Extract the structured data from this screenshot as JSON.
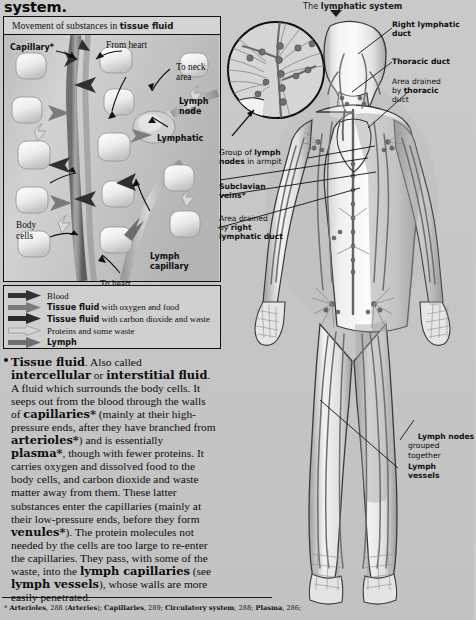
{
  "page": {
    "running_title": "system.",
    "figure_header_prefix": "The ",
    "figure_header_bold": "lymphatic system"
  },
  "panel": {
    "title_prefix": "Movement of substances in ",
    "title_bold": "tissue fluid",
    "labels": {
      "capillary": "Capillary*",
      "from_heart": "From heart",
      "to_neck_area": "To neck\narea",
      "lymph_node": "Lymph\nnode",
      "lymphatic": "Lymphatic",
      "body_cells": "Body\ncells",
      "to_heart": "To heart",
      "lymph_capillary": "Lymph\ncapillary"
    }
  },
  "legend": {
    "title": "Key",
    "rows": [
      {
        "color": "#3a3a3a",
        "style": "solid-dark",
        "bold": "",
        "text": "Blood"
      },
      {
        "color": "#7a7a7a",
        "style": "solid-mid",
        "bold": "Tissue fluid",
        "text": " with oxygen and food"
      },
      {
        "color": "#2e2e2e",
        "style": "solid-dark",
        "bold": "Tissue fluid",
        "text": " with carbon dioxide and waste"
      },
      {
        "color": "#c2c2c2",
        "style": "outline",
        "bold": "",
        "text": "Proteins and some waste"
      },
      {
        "color": "#6e6e6e",
        "style": "solid-mid",
        "bold": "Lymph",
        "text": ""
      }
    ]
  },
  "body_text": {
    "paragraph_html": "<b>Tissue fluid</b>. Also called <b>intercellular</b> or <b>interstitial fluid</b>. A fluid which surrounds the body cells. It seeps out from the blood through the walls of <b>capillaries*</b> (mainly at their high-pressure ends, after they have branched from <b>arterioles*</b>) and is essentially <b>plasma*</b>, though with fewer proteins. It carries oxygen and dissolved food to the body cells, and carbon dioxide and waste matter away from them. These latter substances enter the capillaries (mainly at their low-pressure ends, before they form <b>venules*</b>). The protein molecules not needed by the cells are too large to re-enter the capillaries. They pass, with some of the waste, into the <b>lymph capillaries</b> (see <b>lymph vessels</b>), whose walls are more easily penetrated."
  },
  "footnote": {
    "html": "* <b>Arterioles</b>, 288 (<b>Arteries</b>); <b>Capillaries</b>, 289; <b>Circulatory system</b>, 288; <b>Plasma</b>, 286;"
  },
  "figure_labels": {
    "right_lymphatic_duct": "Right lymphatic\nduct",
    "thoracic_duct": "Thoracic duct",
    "area_drained_thoracic_line1": "Area drained",
    "area_drained_thoracic_line2": "by ",
    "area_drained_thoracic_bold": "thoracic",
    "area_drained_thoracic_line3": "duct",
    "group_lymph_nodes_pre": "Group of ",
    "group_lymph_nodes_bold": "lymph",
    "group_lymph_nodes_bold2": "nodes",
    "group_lymph_nodes_post": " in armpit",
    "subclavian_veins": "Subclavian\nveins*",
    "area_drained_right_line1": "Area drained",
    "area_drained_right_line2": "by ",
    "area_drained_right_bold2": "right",
    "area_drained_right_bold3": "lymphatic duct",
    "lymph_nodes_grouped_bold": "Lymph nodes",
    "lymph_nodes_grouped_rest": "grouped\ntogether",
    "lymph_vessels": "Lymph\nvessels"
  },
  "colors": {
    "page_bg": "#c8c8c8",
    "ink": "#111111",
    "vessel": "#6b6b6b",
    "vessel_dark": "#4a4a4a",
    "body_fill": "#e9e9e9",
    "shade": "#a9a9a9"
  }
}
